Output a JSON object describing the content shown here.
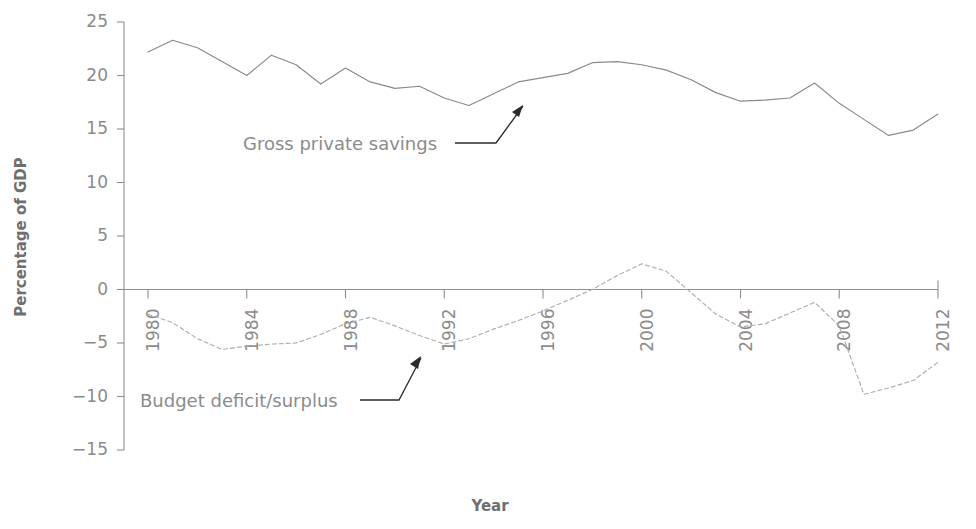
{
  "chart_data": {
    "type": "line",
    "title": "",
    "xlabel": "Year",
    "ylabel": "Percentage of GDP",
    "xlim": [
      1980,
      2012
    ],
    "ylim": [
      -15,
      25
    ],
    "yticks": [
      25,
      20,
      15,
      10,
      5,
      0,
      -5,
      -10,
      -15
    ],
    "ytick_labels": [
      "25",
      "20",
      "15",
      "10",
      "5",
      "0",
      "−5",
      "−10",
      "−15"
    ],
    "xticks": [
      1980,
      1984,
      1988,
      1992,
      1996,
      2000,
      2004,
      2008,
      2012
    ],
    "xtick_labels": [
      "1980",
      "1984",
      "1988",
      "1992",
      "1996",
      "2000",
      "2004",
      "2008",
      "2012"
    ],
    "grid": false,
    "legend_position": "inline-annotations",
    "x": [
      1980,
      1981,
      1982,
      1983,
      1984,
      1985,
      1986,
      1987,
      1988,
      1989,
      1990,
      1991,
      1992,
      1993,
      1994,
      1995,
      1996,
      1997,
      1998,
      1999,
      2000,
      2001,
      2002,
      2003,
      2004,
      2005,
      2006,
      2007,
      2008,
      2009,
      2010,
      2011,
      2012
    ],
    "series": [
      {
        "name": "Gross private savings",
        "style": "solid",
        "color": "#8a8a8a",
        "values": [
          22.2,
          23.3,
          22.6,
          21.3,
          20.0,
          21.9,
          21.0,
          19.2,
          20.7,
          19.4,
          18.8,
          19.0,
          17.9,
          17.2,
          18.3,
          19.4,
          19.8,
          20.2,
          21.2,
          21.3,
          21.0,
          20.5,
          19.6,
          18.4,
          17.6,
          17.7,
          17.9,
          19.3,
          17.4,
          15.9,
          14.4,
          14.9,
          16.4
        ]
      },
      {
        "name": "Budget deficit/surplus",
        "style": "dotted",
        "color": "#aeaeae",
        "values": [
          -2.3,
          -3.1,
          -4.6,
          -5.6,
          -5.3,
          -5.1,
          -5.0,
          -4.2,
          -3.2,
          -2.6,
          -3.4,
          -4.3,
          -5.1,
          -4.6,
          -3.7,
          -2.9,
          -2.0,
          -1.0,
          0.0,
          1.3,
          2.4,
          1.7,
          -0.3,
          -2.3,
          -3.5,
          -3.2,
          -2.2,
          -1.2,
          -3.4,
          -9.8,
          -9.2,
          -8.5,
          -6.8
        ]
      }
    ],
    "annotations": [
      {
        "label": "Gross private savings",
        "points_to_series": "Gross private savings",
        "arrow": true
      },
      {
        "label": "Budget deficit/surplus",
        "points_to_series": "Budget deficit/surplus",
        "arrow": true
      }
    ]
  }
}
